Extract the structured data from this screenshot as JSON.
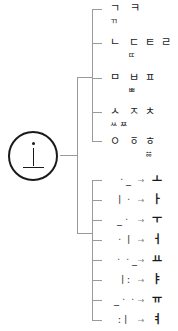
{
  "root": {
    "label": "ㆍ ㅣ ㅡ",
    "description": "basic vowel strokes"
  },
  "consonants": [
    {
      "basic": "ㄱ",
      "derived": [
        "ㅋ"
      ],
      "double": "ㄲ"
    },
    {
      "basic": "ㄴ",
      "derived": [
        "ㄷ",
        "ㅌ",
        "ㄹ"
      ],
      "double": "ㄸ"
    },
    {
      "basic": "ㅁ",
      "derived": [
        "ㅂ",
        "ㅍ"
      ],
      "double": "ㅃ"
    },
    {
      "basic": "ㅅ",
      "derived": [
        "ㅈ",
        "ㅊ"
      ],
      "double": "ㅆ ㅉ"
    },
    {
      "basic": "ㅇ",
      "derived": [
        "ㆆ",
        "ㅎ"
      ],
      "double": "ㆅ"
    }
  ],
  "vowels": [
    {
      "from": "ㆍ_",
      "to": "ㅗ"
    },
    {
      "from": "ㅣㆍ",
      "to": "ㅏ"
    },
    {
      "from": "_ㆍ",
      "to": "ㅜ"
    },
    {
      "from": "ㆍㅣ",
      "to": "ㅓ"
    },
    {
      "from": "ㆍㆍ_",
      "to": "ㅛ"
    },
    {
      "from": "ㅣ:",
      "to": "ㅑ"
    },
    {
      "from": "_ㆍㆍ",
      "to": "ㅠ"
    },
    {
      "from": ":ㅣ",
      "to": "ㅕ"
    }
  ],
  "arrow": "→"
}
